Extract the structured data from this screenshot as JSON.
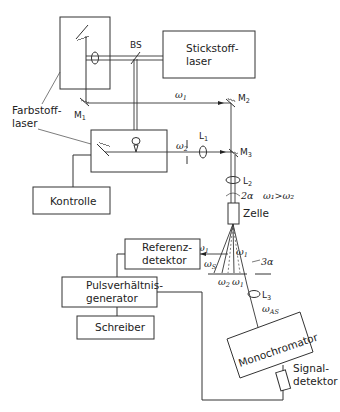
{
  "diagram": {
    "components": {
      "stickstoff": [
        "Stickstoff-",
        "laser"
      ],
      "farbstoff": [
        "Farbstoff-",
        "laser"
      ],
      "kontrolle": "Kontrolle",
      "zelle": "Zelle",
      "referenz": [
        "Referenz-",
        "detektor"
      ],
      "pulsgen": [
        "Pulsverhältnis-",
        "generator"
      ],
      "schreiber": "Schreiber",
      "monochromator": "Monochromator",
      "signal": [
        "Signal-",
        "detektor"
      ]
    },
    "optics": {
      "bs": "BS",
      "m1": "M",
      "m1_sub": "1",
      "m2": "M",
      "m2_sub": "2",
      "m3": "M",
      "m3_sub": "3",
      "l1": "L",
      "l1_sub": "1",
      "l2": "L",
      "l2_sub": "2",
      "l3": "L",
      "l3_sub": "3"
    },
    "beams": {
      "omega1_top": "ω",
      "omega1_top_sub": "1",
      "omega2_mid": "ω",
      "omega2_mid_sub": "2",
      "condition": "ω₁>ω₂",
      "angle_2a": "2α",
      "angle_3a": "3α",
      "omega1_ref": "ω",
      "omega1_ref_sub": "1",
      "omegaS": "ω",
      "omegaS_sub": "S",
      "omega2_low": "ω",
      "omega2_low_sub": "2",
      "omega1_low": "ω",
      "omega1_low_sub": "1",
      "omega1_diag": "ω",
      "omega1_diag_sub": "1",
      "omegaAS": "ω",
      "omegaAS_sub": "AS"
    }
  }
}
